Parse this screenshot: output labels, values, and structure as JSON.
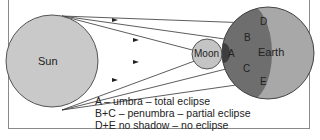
{
  "diagram": {
    "bodies": {
      "sun": {
        "label": "Sun",
        "color": "#c9c9c9"
      },
      "moon": {
        "label": "Moon",
        "color": "#c4c4c4"
      },
      "earth": {
        "label": "Earth",
        "color": "#a8a8a8",
        "shadow_color": "#6e6e6e"
      }
    },
    "region_labels": {
      "a": "A",
      "b": "B",
      "c": "C",
      "d": "D",
      "e": "E"
    },
    "legend": [
      "A – umbra – total eclipse",
      "B+C – penumbra – partial eclipse",
      "D+E no shadow – no eclipse"
    ]
  }
}
